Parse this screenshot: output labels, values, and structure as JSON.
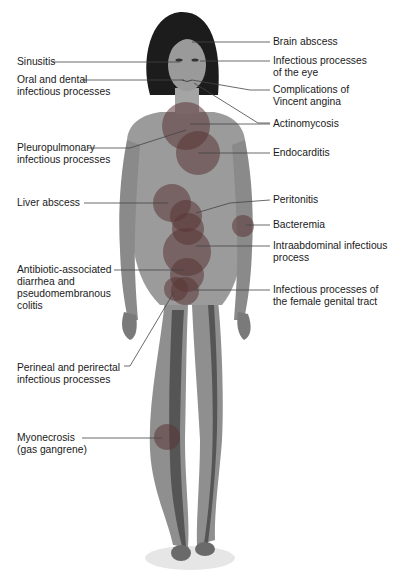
{
  "colors": {
    "skin": "#8f8f8f",
    "skin_light": "#a9a9a9",
    "skin_dark": "#5f5f5f",
    "hair": "#1c1c1c",
    "circle": "#5a3a3a",
    "leader": "#444444"
  },
  "labels_left": [
    {
      "id": "sinusitis",
      "text": "Sinusitis",
      "x": 17,
      "y": 57
    },
    {
      "id": "oral-dental",
      "text": "Oral and dental\ninfectious processes",
      "x": 17,
      "y": 75
    },
    {
      "id": "pleuropulmonary",
      "text": "Pleuropulmonary\ninfectious processes",
      "x": 17,
      "y": 142
    },
    {
      "id": "liver-abscess",
      "text": "Liver abscess",
      "x": 17,
      "y": 198
    },
    {
      "id": "antibiotic-diarrhea",
      "text": "Antibiotic-associated\ndiarrhea and\npseudomembranous\ncolitis",
      "x": 17,
      "y": 265
    },
    {
      "id": "perineal",
      "text": "Perineal and perirectal\ninfectious processes",
      "x": 17,
      "y": 364
    },
    {
      "id": "myonecrosis",
      "text": "Myonecrosis\n(gas gangrene)",
      "x": 17,
      "y": 433
    }
  ],
  "labels_right": [
    {
      "id": "brain-abscess",
      "text": "Brain abscess",
      "x": 273,
      "y": 35
    },
    {
      "id": "eye",
      "text": "Infectious processes\nof the eye",
      "x": 273,
      "y": 54
    },
    {
      "id": "vincent-angina",
      "text": "Complications of\nVincent angina",
      "x": 273,
      "y": 85
    },
    {
      "id": "actinomycosis",
      "text": "Actinomycosis",
      "x": 273,
      "y": 118
    },
    {
      "id": "endocarditis",
      "text": "Endocarditis",
      "x": 273,
      "y": 147
    },
    {
      "id": "peritonitis",
      "text": "Peritonitis",
      "x": 273,
      "y": 194
    },
    {
      "id": "bacteremia",
      "text": "Bacteremia",
      "x": 273,
      "y": 218
    },
    {
      "id": "intraabdominal",
      "text": "Intraabdominal infectious\nprocess",
      "x": 273,
      "y": 240
    },
    {
      "id": "female-genital",
      "text": "Infectious processes of\nthe female genital tract",
      "x": 273,
      "y": 284
    }
  ]
}
